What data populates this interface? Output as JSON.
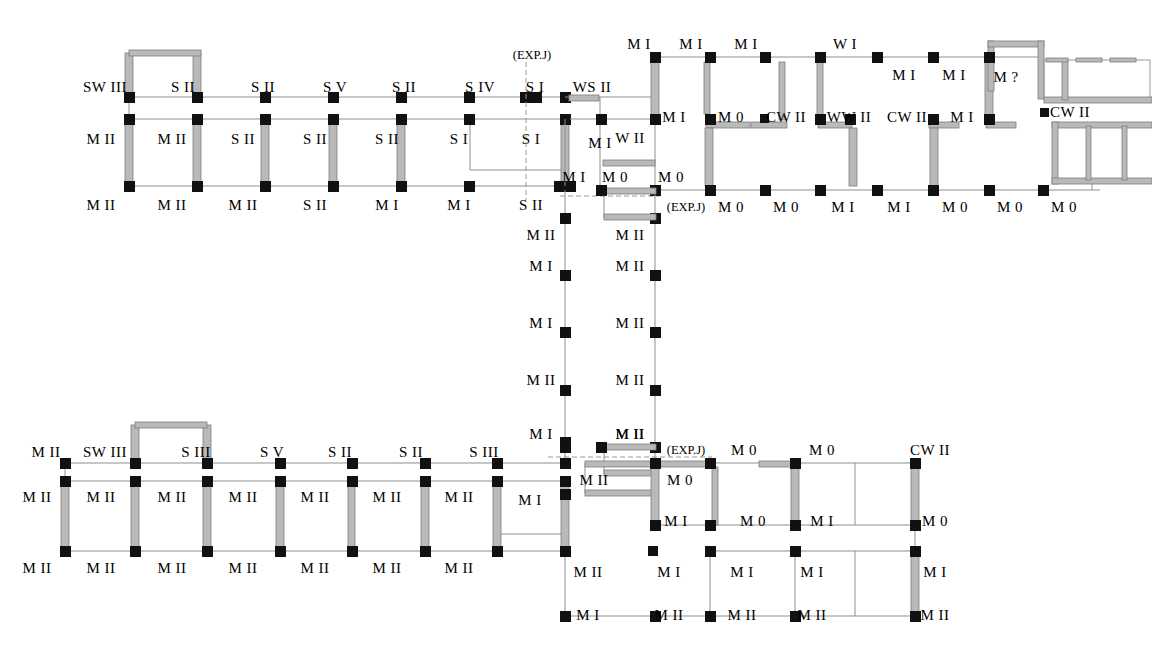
{
  "document": {
    "kind": "structural-damage-floor-plan",
    "title": "",
    "background_color": "#ffffff",
    "ink_color": "#000000",
    "wall_fill_color": "#b9b9b9",
    "wall_edge_color": "#8c8c8c",
    "thin_line_color": "#8f8f8f",
    "node_color": "#111111",
    "dashed_color": "#9a9a9a"
  },
  "legend_terms": {
    "M0": "M 0",
    "MI": "M I",
    "MII": "M II",
    "SI": "S I",
    "SII": "S II",
    "SIII": "S III",
    "SIV": "S IV",
    "SV": "S V",
    "SWIII": "SW III",
    "WI": "W I",
    "WII": "W II",
    "WSII": "WS II",
    "WWII": "WW II",
    "CWII": "CW II",
    "MQ": "M ?",
    "EXPJ": "(EXP.J)"
  },
  "chart_data": {
    "type": "table",
    "xlabel": "",
    "ylabel": "",
    "grid": false,
    "legend": "none",
    "categories": [
      "M 0",
      "M I",
      "M II",
      "M ?",
      "S I",
      "S II",
      "S III",
      "S IV",
      "S V",
      "SW III",
      "W I",
      "W II",
      "WS II",
      "WW II",
      "CW II"
    ],
    "values": [
      18,
      33,
      35,
      1,
      5,
      12,
      2,
      1,
      2,
      2,
      1,
      1,
      1,
      1,
      3
    ]
  },
  "annotations": {
    "north_wing_top_row": [
      {
        "id": "nw-t-1",
        "text": "SW III",
        "x": 105,
        "y": 87,
        "anchor": "center"
      },
      {
        "id": "nw-t-2",
        "text": "S II",
        "x": 183,
        "y": 87,
        "anchor": "center"
      },
      {
        "id": "nw-t-3",
        "text": "S II",
        "x": 263,
        "y": 87,
        "anchor": "center"
      },
      {
        "id": "nw-t-4",
        "text": "S V",
        "x": 335,
        "y": 87,
        "anchor": "center"
      },
      {
        "id": "nw-t-5",
        "text": "S II",
        "x": 404,
        "y": 87,
        "anchor": "center"
      },
      {
        "id": "nw-t-6",
        "text": "S IV",
        "x": 480,
        "y": 87,
        "anchor": "center"
      },
      {
        "id": "nw-t-7",
        "text": "S I",
        "x": 535,
        "y": 87,
        "anchor": "center"
      },
      {
        "id": "nw-t-8",
        "text": "WS II",
        "x": 592,
        "y": 87,
        "anchor": "center"
      }
    ],
    "north_wing_mid_row": [
      {
        "id": "nw-m-1",
        "text": "M II",
        "x": 101,
        "y": 139,
        "anchor": "center"
      },
      {
        "id": "nw-m-2",
        "text": "M II",
        "x": 172,
        "y": 139,
        "anchor": "center"
      },
      {
        "id": "nw-m-3",
        "text": "S II",
        "x": 243,
        "y": 139,
        "anchor": "center"
      },
      {
        "id": "nw-m-4",
        "text": "S II",
        "x": 315,
        "y": 139,
        "anchor": "center"
      },
      {
        "id": "nw-m-5",
        "text": "S II",
        "x": 387,
        "y": 139,
        "anchor": "center"
      },
      {
        "id": "nw-m-6",
        "text": "S I",
        "x": 459,
        "y": 139,
        "anchor": "center"
      },
      {
        "id": "nw-m-7",
        "text": "S I",
        "x": 531,
        "y": 139,
        "anchor": "center"
      }
    ],
    "north_wing_bottom_row": [
      {
        "id": "nw-b-1",
        "text": "M II",
        "x": 101,
        "y": 205,
        "anchor": "center"
      },
      {
        "id": "nw-b-2",
        "text": "M II",
        "x": 172,
        "y": 205,
        "anchor": "center"
      },
      {
        "id": "nw-b-3",
        "text": "M II",
        "x": 243,
        "y": 205,
        "anchor": "center"
      },
      {
        "id": "nw-b-4",
        "text": "S II",
        "x": 315,
        "y": 205,
        "anchor": "center"
      },
      {
        "id": "nw-b-5",
        "text": "M I",
        "x": 387,
        "y": 205,
        "anchor": "center"
      },
      {
        "id": "nw-b-6",
        "text": "M I",
        "x": 459,
        "y": 205,
        "anchor": "center"
      },
      {
        "id": "nw-b-7",
        "text": "S II",
        "x": 531,
        "y": 205,
        "anchor": "center"
      }
    ],
    "north_exp_joints": [
      {
        "id": "nw-exp-1",
        "text": "(EXP.J)",
        "x": 532,
        "y": 55,
        "anchor": "center"
      },
      {
        "id": "nw-exp-2",
        "text": "(EXP.J)",
        "x": 686,
        "y": 207,
        "anchor": "center"
      }
    ],
    "ne_wing_top_row": [
      {
        "id": "ne-t-1",
        "text": "M I",
        "x": 639,
        "y": 44,
        "anchor": "center"
      },
      {
        "id": "ne-t-2",
        "text": "M I",
        "x": 691,
        "y": 44,
        "anchor": "center"
      },
      {
        "id": "ne-t-3",
        "text": "M I",
        "x": 746,
        "y": 44,
        "anchor": "center"
      },
      {
        "id": "ne-t-4",
        "text": "W I",
        "x": 845,
        "y": 44,
        "anchor": "center"
      },
      {
        "id": "ne-t-5",
        "text": "M I",
        "x": 904,
        "y": 75,
        "anchor": "center"
      },
      {
        "id": "ne-t-6",
        "text": "M I",
        "x": 954,
        "y": 75,
        "anchor": "center"
      },
      {
        "id": "ne-t-7",
        "text": "M ?",
        "x": 1006,
        "y": 77,
        "anchor": "center"
      }
    ],
    "ne_wing_mid_row": [
      {
        "id": "ne-m-1",
        "text": "M I",
        "x": 600,
        "y": 143,
        "anchor": "center"
      },
      {
        "id": "ne-m-2",
        "text": "W II",
        "x": 630,
        "y": 138,
        "anchor": "center"
      },
      {
        "id": "ne-m-3",
        "text": "M I",
        "x": 674,
        "y": 117,
        "anchor": "center"
      },
      {
        "id": "ne-m-4",
        "text": "M 0",
        "x": 731,
        "y": 117,
        "anchor": "center"
      },
      {
        "id": "ne-m-5",
        "text": "CW II",
        "x": 786,
        "y": 117,
        "anchor": "center"
      },
      {
        "id": "ne-m-6",
        "text": "WW II",
        "x": 849,
        "y": 117,
        "anchor": "center"
      },
      {
        "id": "ne-m-7",
        "text": "CW II",
        "x": 907,
        "y": 117,
        "anchor": "center"
      },
      {
        "id": "ne-m-8",
        "text": "M I",
        "x": 962,
        "y": 117,
        "anchor": "center"
      },
      {
        "id": "ne-m-9",
        "text": "CW II",
        "x": 1070,
        "y": 112,
        "anchor": "center"
      }
    ],
    "ne_wing_bottom_row": [
      {
        "id": "ne-b-1",
        "text": "M I",
        "x": 574,
        "y": 177,
        "anchor": "center"
      },
      {
        "id": "ne-b-2",
        "text": "M 0",
        "x": 615,
        "y": 177,
        "anchor": "center"
      },
      {
        "id": "ne-b-3",
        "text": "M 0",
        "x": 671,
        "y": 177,
        "anchor": "center"
      },
      {
        "id": "ne-b-4",
        "text": "M 0",
        "x": 731,
        "y": 207,
        "anchor": "center"
      },
      {
        "id": "ne-b-5",
        "text": "M 0",
        "x": 786,
        "y": 207,
        "anchor": "center"
      },
      {
        "id": "ne-b-6",
        "text": "M I",
        "x": 843,
        "y": 207,
        "anchor": "center"
      },
      {
        "id": "ne-b-7",
        "text": "M I",
        "x": 899,
        "y": 207,
        "anchor": "center"
      },
      {
        "id": "ne-b-8",
        "text": "M 0",
        "x": 955,
        "y": 207,
        "anchor": "center"
      },
      {
        "id": "ne-b-9",
        "text": "M 0",
        "x": 1010,
        "y": 207,
        "anchor": "center"
      },
      {
        "id": "ne-b-10",
        "text": "M 0",
        "x": 1064,
        "y": 207,
        "anchor": "center"
      }
    ],
    "spine_left_column": [
      {
        "id": "sp-l-1",
        "text": "M II",
        "x": 541,
        "y": 235,
        "anchor": "center"
      },
      {
        "id": "sp-l-2",
        "text": "M I",
        "x": 541,
        "y": 266,
        "anchor": "center"
      },
      {
        "id": "sp-l-3",
        "text": "M I",
        "x": 541,
        "y": 323,
        "anchor": "center"
      },
      {
        "id": "sp-l-4",
        "text": "M II",
        "x": 541,
        "y": 380,
        "anchor": "center"
      },
      {
        "id": "sp-l-5",
        "text": "M I",
        "x": 541,
        "y": 434,
        "anchor": "center"
      }
    ],
    "spine_right_column": [
      {
        "id": "sp-r-1",
        "text": "M II",
        "x": 630,
        "y": 235,
        "anchor": "center"
      },
      {
        "id": "sp-r-2",
        "text": "M II",
        "x": 630,
        "y": 266,
        "anchor": "center"
      },
      {
        "id": "sp-r-3",
        "text": "M II",
        "x": 630,
        "y": 323,
        "anchor": "center"
      },
      {
        "id": "sp-r-4",
        "text": "M II",
        "x": 630,
        "y": 380,
        "anchor": "center"
      },
      {
        "id": "sp-r-5",
        "text": "M II",
        "x": 630,
        "y": 434,
        "anchor": "center"
      }
    ],
    "south_wing_top_row": [
      {
        "id": "sw-t-0",
        "text": "M II",
        "x": 46,
        "y": 452,
        "anchor": "center"
      },
      {
        "id": "sw-t-1",
        "text": "SW III",
        "x": 105,
        "y": 452,
        "anchor": "center"
      },
      {
        "id": "sw-t-2",
        "text": "S III",
        "x": 196,
        "y": 452,
        "anchor": "center"
      },
      {
        "id": "sw-t-3",
        "text": "S V",
        "x": 272,
        "y": 452,
        "anchor": "center"
      },
      {
        "id": "sw-t-4",
        "text": "S II",
        "x": 340,
        "y": 452,
        "anchor": "center"
      },
      {
        "id": "sw-t-5",
        "text": "S II",
        "x": 411,
        "y": 452,
        "anchor": "center"
      },
      {
        "id": "sw-t-6",
        "text": "S III",
        "x": 484,
        "y": 452,
        "anchor": "center"
      }
    ],
    "south_wing_mid_row": [
      {
        "id": "sw-m-0",
        "text": "M II",
        "x": 37,
        "y": 497,
        "anchor": "center"
      },
      {
        "id": "sw-m-1",
        "text": "M II",
        "x": 101,
        "y": 497,
        "anchor": "center"
      },
      {
        "id": "sw-m-2",
        "text": "M II",
        "x": 172,
        "y": 497,
        "anchor": "center"
      },
      {
        "id": "sw-m-3",
        "text": "M II",
        "x": 243,
        "y": 497,
        "anchor": "center"
      },
      {
        "id": "sw-m-4",
        "text": "M II",
        "x": 315,
        "y": 497,
        "anchor": "center"
      },
      {
        "id": "sw-m-5",
        "text": "M II",
        "x": 387,
        "y": 497,
        "anchor": "center"
      },
      {
        "id": "sw-m-6",
        "text": "M II",
        "x": 459,
        "y": 497,
        "anchor": "center"
      },
      {
        "id": "sw-m-7",
        "text": "M I",
        "x": 530,
        "y": 500,
        "anchor": "center"
      }
    ],
    "south_wing_bottom_row": [
      {
        "id": "sw-b-0",
        "text": "M II",
        "x": 37,
        "y": 568,
        "anchor": "center"
      },
      {
        "id": "sw-b-1",
        "text": "M II",
        "x": 101,
        "y": 568,
        "anchor": "center"
      },
      {
        "id": "sw-b-2",
        "text": "M II",
        "x": 172,
        "y": 568,
        "anchor": "center"
      },
      {
        "id": "sw-b-3",
        "text": "M II",
        "x": 243,
        "y": 568,
        "anchor": "center"
      },
      {
        "id": "sw-b-4",
        "text": "M II",
        "x": 315,
        "y": 568,
        "anchor": "center"
      },
      {
        "id": "sw-b-5",
        "text": "M II",
        "x": 387,
        "y": 568,
        "anchor": "center"
      },
      {
        "id": "sw-b-6",
        "text": "M II",
        "x": 459,
        "y": 568,
        "anchor": "center"
      }
    ],
    "south_exp_joints": [
      {
        "id": "sw-exp-1",
        "text": "(EXP.J)",
        "x": 686,
        "y": 450,
        "anchor": "center"
      }
    ],
    "se_wing": [
      {
        "id": "se-1",
        "text": "M II",
        "x": 630,
        "y": 434,
        "anchor": "center"
      },
      {
        "id": "se-2",
        "text": "M 0",
        "x": 744,
        "y": 450,
        "anchor": "center"
      },
      {
        "id": "se-3",
        "text": "M 0",
        "x": 822,
        "y": 450,
        "anchor": "center"
      },
      {
        "id": "se-4",
        "text": "CW II",
        "x": 930,
        "y": 450,
        "anchor": "center"
      },
      {
        "id": "se-5",
        "text": "M II",
        "x": 594,
        "y": 480,
        "anchor": "center"
      },
      {
        "id": "se-6",
        "text": "M 0",
        "x": 680,
        "y": 480,
        "anchor": "center"
      },
      {
        "id": "se-7",
        "text": "M I",
        "x": 676,
        "y": 521,
        "anchor": "center"
      },
      {
        "id": "se-8",
        "text": "M 0",
        "x": 753,
        "y": 521,
        "anchor": "center"
      },
      {
        "id": "se-9",
        "text": "M I",
        "x": 822,
        "y": 521,
        "anchor": "center"
      },
      {
        "id": "se-10",
        "text": "M 0",
        "x": 935,
        "y": 521,
        "anchor": "center"
      },
      {
        "id": "se-11",
        "text": "M II",
        "x": 588,
        "y": 572,
        "anchor": "center"
      },
      {
        "id": "se-12",
        "text": "M I",
        "x": 669,
        "y": 572,
        "anchor": "center"
      },
      {
        "id": "se-13",
        "text": "M I",
        "x": 742,
        "y": 572,
        "anchor": "center"
      },
      {
        "id": "se-14",
        "text": "M I",
        "x": 812,
        "y": 572,
        "anchor": "center"
      },
      {
        "id": "se-15",
        "text": "M I",
        "x": 935,
        "y": 572,
        "anchor": "center"
      },
      {
        "id": "se-16",
        "text": "M I",
        "x": 588,
        "y": 615,
        "anchor": "center"
      },
      {
        "id": "se-17",
        "text": "M II",
        "x": 669,
        "y": 615,
        "anchor": "center"
      },
      {
        "id": "se-18",
        "text": "M II",
        "x": 742,
        "y": 615,
        "anchor": "center"
      },
      {
        "id": "se-19",
        "text": "M II",
        "x": 812,
        "y": 615,
        "anchor": "center"
      },
      {
        "id": "se-20",
        "text": "M II",
        "x": 935,
        "y": 615,
        "anchor": "center"
      }
    ]
  },
  "geometry": {
    "north_grid_x": [
      129,
      197,
      265,
      333,
      401,
      470,
      525,
      534,
      565
    ],
    "north_grid_y": [
      97,
      119,
      186
    ],
    "northeast_x": [
      655,
      710,
      765,
      820,
      877,
      933,
      990,
      1043
    ],
    "northeast_y": [
      57,
      119,
      190
    ],
    "spine_x": [
      565,
      655
    ],
    "spine_y": [
      190,
      218,
      275,
      332,
      390,
      447
    ],
    "south_grid_x": [
      65,
      135,
      207,
      280,
      352,
      425,
      497,
      565
    ],
    "south_grid_y": [
      463,
      481,
      551
    ],
    "southeast_x": [
      565,
      610,
      655,
      710,
      795,
      880,
      915
    ],
    "southeast_y": [
      463,
      525,
      551,
      616
    ]
  }
}
